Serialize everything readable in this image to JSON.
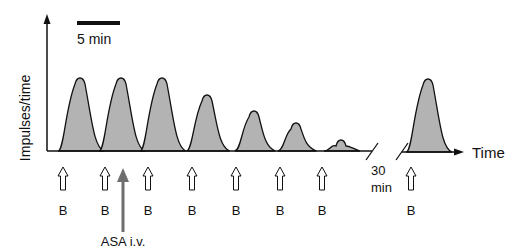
{
  "figure": {
    "y_axis_label": "Impulses/time",
    "x_axis_label": "Time",
    "scale_bar_label": "5 min",
    "gap_label_line1": "30",
    "gap_label_line2": "min",
    "drug_label": "ASA i.v.",
    "stimulus_label": "B",
    "colors": {
      "peak_fill": "#b3b3b3",
      "stroke": "#111111",
      "drug_arrow": "#6e6e6e"
    }
  },
  "peaks": [
    {
      "x": 80,
      "top": 76
    },
    {
      "x": 121,
      "top": 76
    },
    {
      "x": 162,
      "top": 76
    },
    {
      "x": 207,
      "top": 93
    },
    {
      "x": 254,
      "top": 109
    },
    {
      "x": 296,
      "top": 121
    },
    {
      "x": 341,
      "top": 138
    },
    {
      "x": 428,
      "top": 77
    }
  ],
  "stimuli": [
    {
      "x": 63,
      "label": "B"
    },
    {
      "x": 105,
      "label": "B"
    },
    {
      "x": 148,
      "label": "B"
    },
    {
      "x": 192,
      "label": "B"
    },
    {
      "x": 236,
      "label": "B"
    },
    {
      "x": 280,
      "label": "B"
    },
    {
      "x": 322,
      "label": "B"
    },
    {
      "x": 411,
      "label": "B"
    }
  ],
  "drug_arrow_x": 123
}
